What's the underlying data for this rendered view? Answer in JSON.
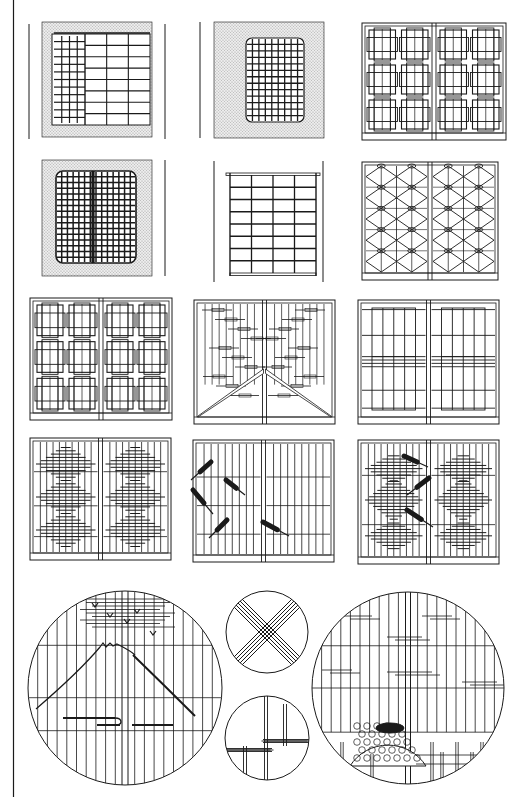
{
  "sheet": {
    "title_visible": false,
    "background": "#ffffff",
    "ink": "#1a1a1a",
    "stipple": "#d4d4d4",
    "margin_rule": {
      "x": 13.5,
      "y1": 0,
      "y2": 797
    }
  },
  "panels": [
    {
      "id": "p1",
      "name": "window-sliding-lattice-stippled-wall",
      "type": "wall_window_split",
      "x": 42,
      "y": 22,
      "w": 110,
      "h": 115,
      "side_lines": [
        29,
        165
      ]
    },
    {
      "id": "p2",
      "name": "window-rounded-grid-stippled-wall",
      "type": "wall_rounded_grid",
      "x": 214,
      "y": 22,
      "w": 110,
      "h": 116,
      "side_lines": [
        200
      ]
    },
    {
      "id": "p3",
      "name": "shoji-interlocking-squares",
      "type": "shoji_squares",
      "x": 362,
      "y": 23,
      "w": 144,
      "h": 117
    },
    {
      "id": "p4",
      "name": "window-rounded-dense-grid-stippled",
      "type": "wall_dense_grid",
      "x": 42,
      "y": 160,
      "w": 110,
      "h": 116,
      "side_lines": [
        165
      ]
    },
    {
      "id": "p5",
      "name": "shoji-standing-frame-grid",
      "type": "standing_grid",
      "x": 228,
      "y": 173,
      "w": 90,
      "h": 103,
      "side_lines": [
        214,
        323
      ]
    },
    {
      "id": "p6",
      "name": "shoji-diamond-lattice",
      "type": "shoji_diamond",
      "x": 362,
      "y": 162,
      "w": 136,
      "h": 118
    },
    {
      "id": "p7",
      "name": "shoji-interlocking-squares-tall",
      "type": "shoji_squares",
      "x": 30,
      "y": 298,
      "w": 142,
      "h": 122
    },
    {
      "id": "p8",
      "name": "shoji-mountain-slope-sparse",
      "type": "shoji_mountain",
      "x": 194,
      "y": 300,
      "w": 141,
      "h": 124
    },
    {
      "id": "p9",
      "name": "shoji-framed-vertical-bars",
      "type": "shoji_frames",
      "x": 358,
      "y": 300,
      "w": 141,
      "h": 124
    },
    {
      "id": "p10",
      "name": "shoji-stacked-diamond-bars",
      "type": "shoji_stack_diamond",
      "x": 30,
      "y": 438,
      "w": 141,
      "h": 122
    },
    {
      "id": "p11",
      "name": "shoji-fans-brushes",
      "type": "shoji_brushes",
      "x": 193,
      "y": 440,
      "w": 141,
      "h": 122
    },
    {
      "id": "p12",
      "name": "shoji-double-diamond-bars",
      "type": "shoji_double_diamond",
      "x": 358,
      "y": 440,
      "w": 141,
      "h": 124
    }
  ],
  "circles": [
    {
      "id": "c1",
      "name": "round-window-mount-fuji",
      "type": "fuji",
      "cx": 125,
      "cy": 688,
      "r": 97
    },
    {
      "id": "c2",
      "name": "round-window-crossed-bamboo",
      "type": "cross",
      "cx": 267,
      "cy": 632,
      "r": 41
    },
    {
      "id": "c3",
      "name": "round-window-bamboo-joints",
      "type": "bamboo",
      "cx": 267,
      "cy": 738,
      "r": 42
    },
    {
      "id": "c4",
      "name": "round-window-basket-fence",
      "type": "basket",
      "cx": 408,
      "cy": 688,
      "r": 96
    }
  ]
}
